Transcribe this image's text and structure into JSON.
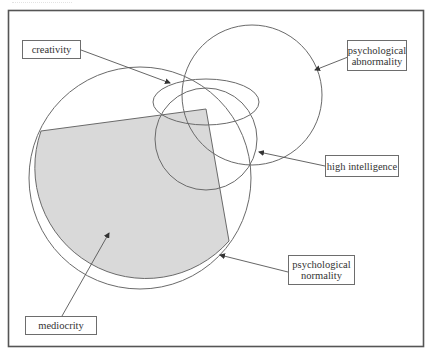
{
  "diagram": {
    "type": "venn-euler",
    "colors": {
      "frame": "#555555",
      "stroke": "#6a6a6a",
      "shaded_fill": "#d9d9d9",
      "background": "#ffffff",
      "label_text": "#333333"
    },
    "regions": [
      {
        "id": "psychological-normality",
        "shape": "circle",
        "cx": 140,
        "cy": 178,
        "r": 111
      },
      {
        "id": "psychological-abnormality",
        "shape": "circle",
        "cx": 252,
        "cy": 95,
        "r": 70
      },
      {
        "id": "creativity",
        "shape": "ellipse",
        "cx": 206,
        "cy": 102,
        "rx": 53,
        "ry": 23
      },
      {
        "id": "high-intelligence",
        "shape": "circle",
        "cx": 206,
        "cy": 139,
        "r": 51
      },
      {
        "id": "mediocrity",
        "shape": "shaded-region"
      }
    ],
    "labels": {
      "creativity": "creativity",
      "abnormality_line1": "psychological",
      "abnormality_line2": "abnormality",
      "high_intelligence": "high intelligence",
      "normality_line1": "psychological",
      "normality_line2": "normality",
      "mediocrity": "mediocrity"
    }
  }
}
